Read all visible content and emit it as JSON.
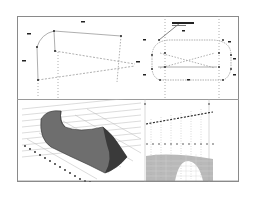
{
  "drawing": {
    "colors": {
      "frame": "#8a8a8a",
      "line": "#9a9a9a",
      "point": "#222222",
      "surface_dark": "#3a3a3a",
      "surface_mid": "#6e6e6e",
      "grid": "#b8b8b8",
      "hatch": "#a8a8a8"
    },
    "views": [
      {
        "id": "perspective-wireframe",
        "position": "top-left"
      },
      {
        "id": "front-elevation",
        "position": "top-right"
      },
      {
        "id": "shaded-surface-3d",
        "position": "bottom-left"
      },
      {
        "id": "side-elevation-profile",
        "position": "bottom-right"
      }
    ]
  }
}
